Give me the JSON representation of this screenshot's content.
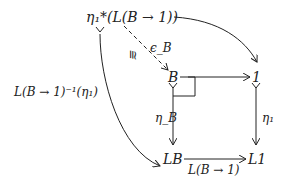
{
  "diagram": {
    "type": "commutative-diagram",
    "nodes": {
      "top": "η₁*(L(B → 1))",
      "B": "B",
      "one": "1",
      "LB": "LB",
      "L1": "L1"
    },
    "edges": {
      "left_curve": "L(B → 1)⁻¹(η₁)",
      "dashed_eps": "ϵ_B",
      "dashed_iso": "≅",
      "eta_B": "η_B",
      "eta_1": "η₁",
      "bottom": "L(B → 1)"
    },
    "edge_list": [
      {
        "from": "top",
        "to": "one",
        "style": "solid-curved",
        "label": ""
      },
      {
        "from": "top",
        "to": "B",
        "style": "dashed",
        "label": "ϵ_B",
        "iso": true
      },
      {
        "from": "top",
        "to": "LB",
        "style": "solid-curved-mono",
        "label": "L(B → 1)⁻¹(η₁)"
      },
      {
        "from": "B",
        "to": "one",
        "style": "solid",
        "label": ""
      },
      {
        "from": "B",
        "to": "LB",
        "style": "mono",
        "label": "η_B"
      },
      {
        "from": "one",
        "to": "L1",
        "style": "mono",
        "label": "η₁"
      },
      {
        "from": "LB",
        "to": "L1",
        "style": "solid",
        "label": "L(B → 1)"
      }
    ],
    "pullback_marker": true
  }
}
